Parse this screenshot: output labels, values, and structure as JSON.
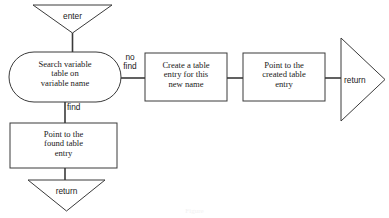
{
  "diagram": {
    "type": "flowchart",
    "stroke_color": "#3a3a3a",
    "text_color": "#1a1a1a",
    "background_color": "#ffffff",
    "caption": "Figure"
  },
  "nodes": {
    "enter_terminal": {
      "label": "enter",
      "shape": "triangle-down"
    },
    "search_process": {
      "label": "Search variable\ntable on\nvariable name",
      "shape": "stadium"
    },
    "create_entry": {
      "label": "Create a table\nentry for this\nnew name",
      "shape": "rectangle"
    },
    "point_created": {
      "label": "Point to the\ncreated  table\nentry",
      "shape": "rectangle"
    },
    "point_found": {
      "label": "Point to the\nfound table\nentry",
      "shape": "rectangle"
    },
    "return_right": {
      "label": "return",
      "shape": "triangle-right"
    },
    "return_bottom": {
      "label": "return",
      "shape": "triangle-down"
    }
  },
  "edges": {
    "no_find": {
      "label": "no\nfind"
    },
    "find": {
      "label": "find"
    }
  }
}
